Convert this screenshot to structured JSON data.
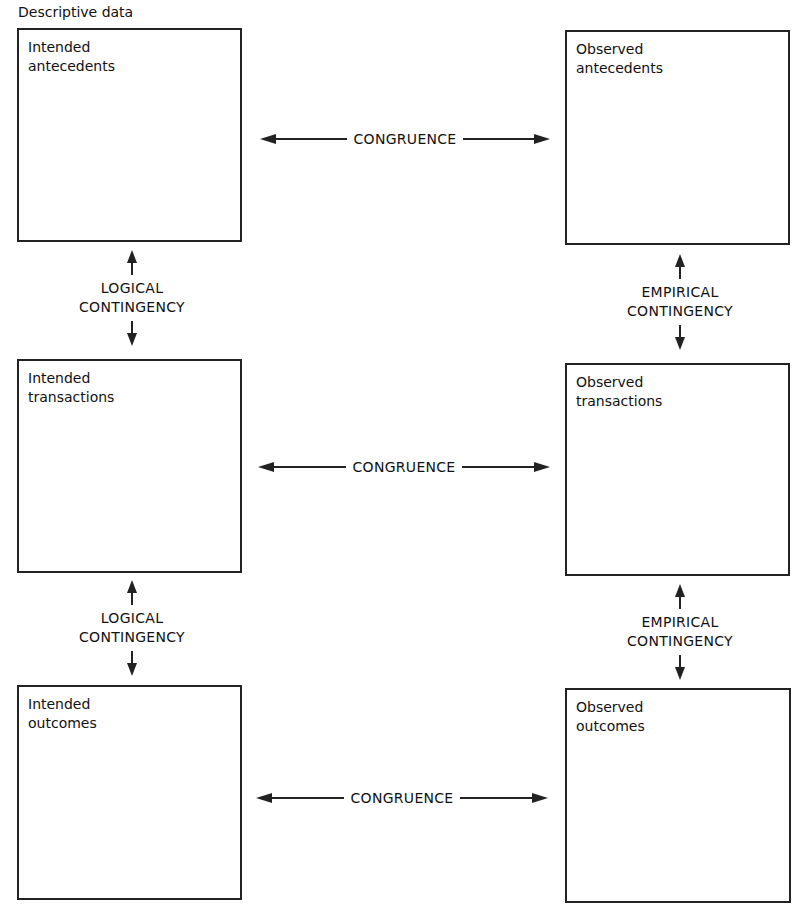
{
  "title": "Descriptive data",
  "boxes": {
    "intended_antecedents": "Intended\nantecedents",
    "observed_antecedents": "Observed\nantecedents",
    "intended_transactions": "Intended\ntransactions",
    "observed_transactions": "Observed\ntransactions",
    "intended_outcomes": "Intended\noutcomes",
    "observed_outcomes": "Observed\noutcomes"
  },
  "relations": {
    "congruence": [
      "CONGRUENCE",
      "CONGRUENCE",
      "CONGRUENCE"
    ],
    "logical_contingency": [
      "LOGICAL\nCONTINGENCY",
      "LOGICAL\nCONTINGENCY"
    ],
    "empirical_contingency": [
      "EMPIRICAL\nCONTINGENCY",
      "EMPIRICAL\nCONTINGENCY"
    ]
  }
}
